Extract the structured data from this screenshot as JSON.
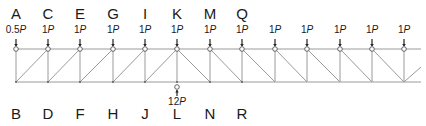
{
  "diagram": {
    "type": "truss",
    "top_chord_y": 49,
    "bottom_chord_y": 82,
    "chord_x_start": 16,
    "chord_x_end": 421,
    "line_color": "#9a9a9a",
    "node_color": "#555555"
  },
  "top_nodes": [
    {
      "label": "A",
      "x": 16,
      "load": "0.5",
      "unit": "P"
    },
    {
      "label": "C",
      "x": 48,
      "load": "1",
      "unit": "P"
    },
    {
      "label": "E",
      "x": 80,
      "load": "1",
      "unit": "P"
    },
    {
      "label": "G",
      "x": 113,
      "load": "1",
      "unit": "P"
    },
    {
      "label": "I",
      "x": 145,
      "load": "1",
      "unit": "P"
    },
    {
      "label": "K",
      "x": 177,
      "load": "1",
      "unit": "P"
    },
    {
      "label": "M",
      "x": 210,
      "load": "1",
      "unit": "P"
    },
    {
      "label": "Q",
      "x": 242,
      "load": "1",
      "unit": "P"
    },
    {
      "label": "",
      "x": 275,
      "load": "1",
      "unit": "P"
    },
    {
      "label": "",
      "x": 307,
      "load": "1",
      "unit": "P"
    },
    {
      "label": "",
      "x": 340,
      "load": "1",
      "unit": "P"
    },
    {
      "label": "",
      "x": 372,
      "load": "1",
      "unit": "P"
    },
    {
      "label": "",
      "x": 404,
      "load": "1",
      "unit": "P"
    }
  ],
  "bottom_nodes": [
    {
      "label": "B",
      "x": 16
    },
    {
      "label": "D",
      "x": 48
    },
    {
      "label": "F",
      "x": 80
    },
    {
      "label": "H",
      "x": 113
    },
    {
      "label": "J",
      "x": 145
    },
    {
      "label": "L",
      "x": 177
    },
    {
      "label": "N",
      "x": 210
    },
    {
      "label": "R",
      "x": 242
    }
  ],
  "reaction": {
    "node": "L",
    "x": 177,
    "value": "12",
    "unit": "P"
  }
}
